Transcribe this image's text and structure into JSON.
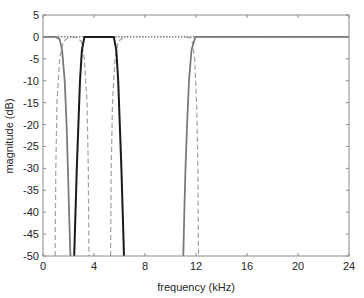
{
  "chart_data": {
    "type": "line",
    "title": "",
    "xlabel": "frequency (kHz)",
    "ylabel": "magnitude (dB)",
    "xlim": [
      0,
      24
    ],
    "ylim": [
      -50,
      5
    ],
    "xticks": [
      0,
      4,
      8,
      12,
      16,
      20,
      24
    ],
    "yticks": [
      5,
      0,
      -5,
      -10,
      -15,
      -20,
      -25,
      -30,
      -35,
      -40,
      -45,
      -50
    ],
    "grid": false,
    "legend": null,
    "series": [
      {
        "name": "lowpass (solid gray)",
        "style": "solid",
        "color": "#7a7a7a",
        "x": [
          0,
          1.0,
          1.3,
          1.5,
          1.7,
          1.85,
          1.95,
          2.05,
          2.15
        ],
        "y": [
          0,
          0,
          -0.5,
          -3,
          -10,
          -20,
          -30,
          -40,
          -50
        ]
      },
      {
        "name": "bandpass (solid black)",
        "style": "solid",
        "color": "#1a1a1a",
        "x": [
          2.45,
          2.55,
          2.65,
          2.78,
          2.9,
          3.05,
          3.25,
          5.55,
          5.75,
          5.9,
          6.02,
          6.15,
          6.25,
          6.35
        ],
        "y": [
          -50,
          -40,
          -30,
          -20,
          -10,
          -3,
          0,
          0,
          -3,
          -10,
          -20,
          -30,
          -40,
          -50
        ]
      },
      {
        "name": "highpass (solid gray)",
        "style": "solid",
        "color": "#7a7a7a",
        "x": [
          11.0,
          11.08,
          11.18,
          11.3,
          11.45,
          11.65,
          11.95,
          24
        ],
        "y": [
          -50,
          -40,
          -30,
          -20,
          -10,
          -3,
          0,
          0
        ]
      },
      {
        "name": "dashed filter edge 1",
        "style": "dashed",
        "color": "#a0a0a0",
        "x": [
          0.95,
          1.0,
          1.1,
          1.3,
          1.6,
          2.0,
          2.3
        ],
        "y": [
          -50,
          -30,
          -15,
          -5,
          -1,
          -0.2,
          0
        ]
      },
      {
        "name": "dashed filter edge 2",
        "style": "dashed",
        "color": "#a0a0a0",
        "x": [
          2.3,
          2.7,
          3.0,
          3.25,
          3.45,
          3.55,
          3.6
        ],
        "y": [
          0,
          -0.2,
          -1,
          -5,
          -15,
          -30,
          -50
        ]
      },
      {
        "name": "dashed filter edge 3",
        "style": "dashed",
        "color": "#a0a0a0",
        "x": [
          5.3,
          5.35,
          5.45,
          5.65,
          5.9,
          6.3,
          6.6
        ],
        "y": [
          -50,
          -30,
          -15,
          -5,
          -1,
          -0.2,
          0
        ]
      },
      {
        "name": "dashed filter edge 4",
        "style": "dashed",
        "color": "#a0a0a0",
        "x": [
          11.2,
          11.5,
          11.7,
          11.9,
          12.05,
          12.15,
          12.2
        ],
        "y": [
          0,
          -0.2,
          -1,
          -5,
          -15,
          -30,
          -50
        ]
      },
      {
        "name": "0 dB reference (dotted)",
        "style": "dotted",
        "color": "#606060",
        "x": [
          0,
          24
        ],
        "y": [
          0,
          0
        ]
      }
    ]
  }
}
